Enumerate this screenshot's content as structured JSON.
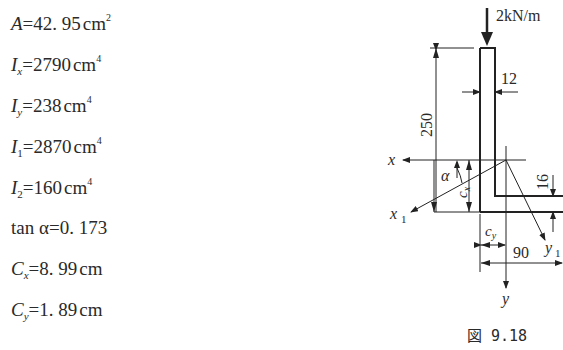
{
  "properties": [
    {
      "symbol": "A",
      "sub": "",
      "value": "42. 95",
      "unit": "cm",
      "exp": "2"
    },
    {
      "symbol": "I",
      "sub": "x",
      "value": "2790",
      "unit": "cm",
      "exp": "4"
    },
    {
      "symbol": "I",
      "sub": "y",
      "value": "238",
      "unit": "cm",
      "exp": "4"
    },
    {
      "symbol": "I",
      "sub": "1",
      "value": "2870",
      "unit": "cm",
      "exp": "4"
    },
    {
      "symbol": "I",
      "sub": "2",
      "value": "160",
      "unit": "cm",
      "exp": "4"
    },
    {
      "symbol": "tan α",
      "sub": "",
      "value": "0. 173",
      "unit": "",
      "exp": ""
    },
    {
      "symbol": "C",
      "sub": "x",
      "value": "8. 99",
      "unit": "cm",
      "exp": ""
    },
    {
      "symbol": "C",
      "sub": "y",
      "value": "1. 89",
      "unit": "cm",
      "exp": ""
    }
  ],
  "diagram": {
    "load_label": "2kN/m",
    "dim_height": "250",
    "dim_thickness_vertical": "12",
    "dim_thickness_horizontal": "16",
    "dim_width": "90",
    "axis_x": "x",
    "axis_y": "y",
    "axis_x1": "x",
    "axis_x1_sub": "1",
    "axis_y1": "y",
    "axis_y1_sub": "1",
    "angle_label": "α",
    "cx_label": "c",
    "cx_sub": "x",
    "cy_label": "c",
    "cy_sub": "y",
    "caption": "図 9.18"
  }
}
